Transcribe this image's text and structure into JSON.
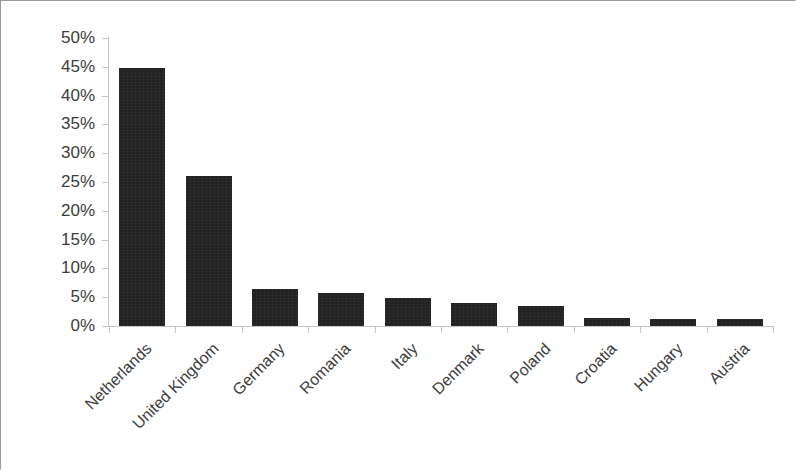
{
  "figure": {
    "background_color": "#ffffff",
    "frame_color": "#999999",
    "axis_color": "#c6c6c6",
    "bar_color": "#212121",
    "tick_label_color": "#3d3d3d"
  },
  "chart_data": {
    "type": "bar",
    "title": "",
    "subtitle": "",
    "xlabel": "",
    "ylabel": "",
    "categories": [
      "Netherlands",
      "United Kingdom",
      "Germany",
      "Romania",
      "Italy",
      "Denmark",
      "Poland",
      "Croatia",
      "Hungary",
      "Austria"
    ],
    "values": [
      44.8,
      26.1,
      6.5,
      5.8,
      4.8,
      4.0,
      3.5,
      1.4,
      1.3,
      1.2
    ],
    "value_unit": "%",
    "ylim": [
      0,
      50
    ],
    "ytick_step": 5,
    "ytick_labels": [
      "0%",
      "5%",
      "10%",
      "15%",
      "20%",
      "25%",
      "30%",
      "35%",
      "40%",
      "45%",
      "50%"
    ],
    "ytick_values": [
      0,
      5,
      10,
      15,
      20,
      25,
      30,
      35,
      40,
      45,
      50
    ],
    "grid": false,
    "legend": false,
    "legend_position": "none",
    "xtick_label_rotation": -45,
    "series": [
      {
        "name": "",
        "values": [
          44.8,
          26.1,
          6.5,
          5.8,
          4.8,
          4.0,
          3.5,
          1.4,
          1.3,
          1.2
        ]
      }
    ],
    "annotations": []
  }
}
